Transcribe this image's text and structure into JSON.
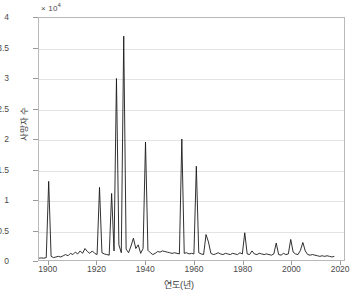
{
  "chart_data": {
    "type": "line",
    "title": "",
    "xlabel": "연도(년)",
    "ylabel": "사망자 수",
    "y_exponent_label": "× 10",
    "y_exponent_power": "4",
    "y_scale": 10000,
    "xlim": [
      1896,
      2022
    ],
    "ylim": [
      0,
      40000
    ],
    "xticks": [
      "1900",
      "1920",
      "1940",
      "1960",
      "1980",
      "2000",
      "2020"
    ],
    "xtick_values": [
      1900,
      1920,
      1940,
      1960,
      1980,
      2000,
      2020
    ],
    "yticks": [
      "0",
      "0.5",
      "1",
      "1.5",
      "2",
      "2.5",
      "3",
      "3.5",
      "4"
    ],
    "ytick_values": [
      0,
      5000,
      10000,
      15000,
      20000,
      25000,
      30000,
      35000,
      40000
    ],
    "grid": "horizontal",
    "legend": "none",
    "line_color": "#1a1a1a",
    "grid_color": "#e3e3e3",
    "axis_color": "#b9b9b9",
    "x": [
      1896,
      1897,
      1898,
      1899,
      1900,
      1901,
      1902,
      1903,
      1904,
      1905,
      1906,
      1907,
      1908,
      1909,
      1910,
      1911,
      1912,
      1913,
      1914,
      1915,
      1916,
      1917,
      1918,
      1919,
      1920,
      1921,
      1922,
      1923,
      1924,
      1925,
      1926,
      1927,
      1928,
      1929,
      1930,
      1931,
      1932,
      1933,
      1934,
      1935,
      1936,
      1937,
      1938,
      1939,
      1940,
      1941,
      1942,
      1943,
      1944,
      1945,
      1946,
      1947,
      1948,
      1949,
      1950,
      1951,
      1952,
      1953,
      1954,
      1955,
      1956,
      1957,
      1958,
      1959,
      1960,
      1961,
      1962,
      1963,
      1964,
      1965,
      1966,
      1967,
      1968,
      1969,
      1970,
      1971,
      1972,
      1973,
      1974,
      1975,
      1976,
      1977,
      1978,
      1979,
      1980,
      1981,
      1982,
      1983,
      1984,
      1985,
      1986,
      1987,
      1988,
      1989,
      1990,
      1991,
      1992,
      1993,
      1994,
      1995,
      1996,
      1997,
      1998,
      1999,
      2000,
      2001,
      2002,
      2003,
      2004,
      2005,
      2006,
      2007,
      2008,
      2009,
      2010,
      2011,
      2012,
      2013,
      2014,
      2015,
      2016,
      2017,
      2018,
      2019,
      2020
    ],
    "y": [
      300,
      350,
      300,
      400,
      13000,
      600,
      400,
      500,
      600,
      500,
      700,
      900,
      700,
      1100,
      900,
      1300,
      1000,
      1500,
      1100,
      1900,
      1400,
      1100,
      1500,
      1100,
      900,
      12000,
      1200,
      1000,
      900,
      800,
      11000,
      1500,
      30000,
      2500,
      1200,
      37000,
      1800,
      1200,
      2300,
      3600,
      1900,
      2500,
      1100,
      1900,
      19500,
      1600,
      1200,
      900,
      1100,
      1400,
      1300,
      1500,
      1400,
      1300,
      1200,
      1100,
      1200,
      1100,
      1000,
      20000,
      1100,
      1200,
      1000,
      1100,
      1000,
      15500,
      1200,
      1000,
      900,
      4200,
      3000,
      1100,
      900,
      1000,
      1200,
      1000,
      900,
      1100,
      1000,
      900,
      1100,
      1000,
      900,
      1200,
      1000,
      4500,
      1000,
      900,
      1500,
      1000,
      900,
      1100,
      1000,
      900,
      1000,
      900,
      800,
      1000,
      2800,
      900,
      800,
      1100,
      900,
      1000,
      3400,
      1300,
      1000,
      900,
      1600,
      2900,
      1500,
      900,
      800,
      900,
      800,
      700,
      600,
      700,
      600,
      700,
      600,
      500,
      600
    ]
  }
}
